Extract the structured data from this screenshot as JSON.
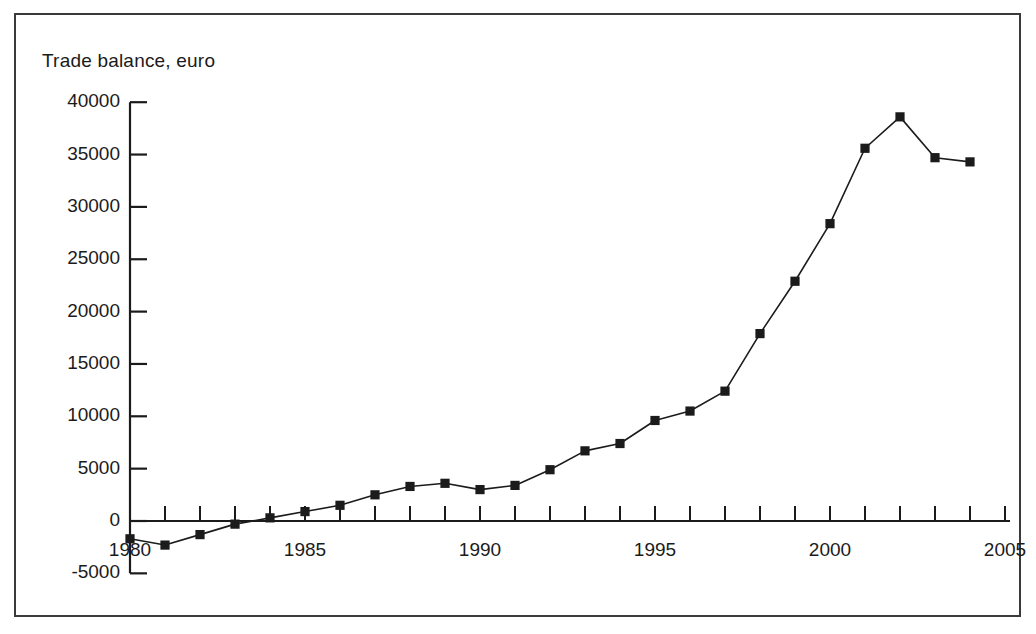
{
  "figure": {
    "background_color": "#ffffff",
    "border_color": "#3a3a3a",
    "ink_color": "#1b1b1b"
  },
  "chart_data": {
    "type": "line",
    "title": "Trade balance, euro",
    "xlabel": "",
    "ylabel": "",
    "grid": false,
    "legend": "none",
    "marker": "square",
    "line_color": "#1b1b1b",
    "marker_color": "#1b1b1b",
    "xlim": [
      1979.5,
      2005.5
    ],
    "ylim": [
      -5000,
      40000
    ],
    "xticks": [
      1980,
      1981,
      1982,
      1983,
      1984,
      1985,
      1986,
      1987,
      1988,
      1989,
      1990,
      1991,
      1992,
      1993,
      1994,
      1995,
      1996,
      1997,
      1998,
      1999,
      2000,
      2001,
      2002,
      2003,
      2004,
      2005
    ],
    "xtick_labels": [
      {
        "value": 1980,
        "label": "1980"
      },
      {
        "value": 1985,
        "label": "1985"
      },
      {
        "value": 1990,
        "label": "1990"
      },
      {
        "value": 1995,
        "label": "1995"
      },
      {
        "value": 2000,
        "label": "2000"
      },
      {
        "value": 2005,
        "label": "2005"
      }
    ],
    "yticks": [
      -5000,
      0,
      5000,
      10000,
      15000,
      20000,
      25000,
      30000,
      35000,
      40000
    ],
    "ytick_labels": [
      "-5000",
      "0",
      "5000",
      "10000",
      "15000",
      "20000",
      "25000",
      "30000",
      "35000",
      "40000"
    ],
    "x": [
      1980,
      1981,
      1982,
      1983,
      1984,
      1985,
      1986,
      1987,
      1988,
      1989,
      1990,
      1991,
      1992,
      1993,
      1994,
      1995,
      1996,
      1997,
      1998,
      1999,
      2000,
      2001,
      2002,
      2003,
      2004
    ],
    "values": [
      -1700,
      -2300,
      -1300,
      -300,
      300,
      900,
      1500,
      2500,
      3300,
      3600,
      3000,
      3400,
      4900,
      6700,
      7400,
      9600,
      10500,
      12400,
      17900,
      22900,
      28400,
      35600,
      38600,
      34700,
      34300
    ],
    "series": [
      {
        "name": "Trade balance, euro",
        "x": [
          1980,
          1981,
          1982,
          1983,
          1984,
          1985,
          1986,
          1987,
          1988,
          1989,
          1990,
          1991,
          1992,
          1993,
          1994,
          1995,
          1996,
          1997,
          1998,
          1999,
          2000,
          2001,
          2002,
          2003,
          2004
        ],
        "values": [
          -1700,
          -2300,
          -1300,
          -300,
          300,
          900,
          1500,
          2500,
          3300,
          3600,
          3000,
          3400,
          4900,
          6700,
          7400,
          9600,
          10500,
          12400,
          17900,
          22900,
          28400,
          35600,
          38600,
          34700,
          34300
        ]
      }
    ]
  }
}
